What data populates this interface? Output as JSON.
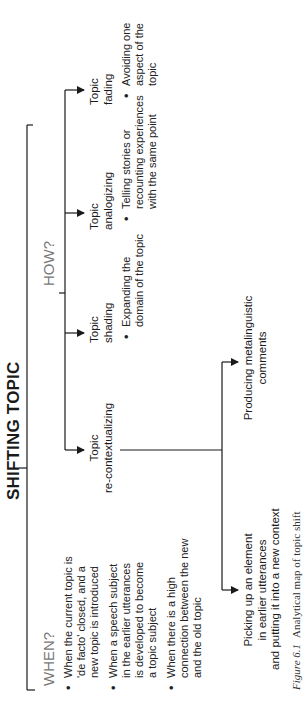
{
  "title": "SHIFTING TOPIC",
  "when": {
    "label": "WHEN?",
    "bullets": [
      [
        "When the current topic is",
        "'de facto' closed, and a",
        "new topic is introduced"
      ],
      [
        "When a speech subject",
        "in the earlier utterances",
        "is developed to become",
        "a topic subject"
      ],
      [
        "When there is a high",
        "connection between the new",
        "and the old topic"
      ]
    ]
  },
  "how": {
    "label": "HOW?",
    "branches": [
      {
        "name": [
          "Topic",
          "re-contextualizing"
        ],
        "sub": [
          [
            "Picking up an element",
            "in earlier utterances",
            "and putting it into a new context"
          ],
          [
            "Producing metalinguistic",
            "comments"
          ]
        ]
      },
      {
        "name": [
          "Topic",
          "shading"
        ],
        "bullet": [
          "Expanding the",
          "domain of the topic"
        ]
      },
      {
        "name": [
          "Topic",
          "analogizing"
        ],
        "bullet": [
          "Telling stories or",
          "recounting experiences",
          "with the same point"
        ]
      },
      {
        "name": [
          "Topic",
          "fading"
        ],
        "bullet": [
          "Avoiding one",
          "aspect of the",
          "topic"
        ]
      }
    ]
  },
  "caption": {
    "label": "Figure 6.1",
    "text": "Analytical map of topic shift"
  },
  "colors": {
    "line": "#1a1a1a",
    "section_label": "#777777"
  }
}
